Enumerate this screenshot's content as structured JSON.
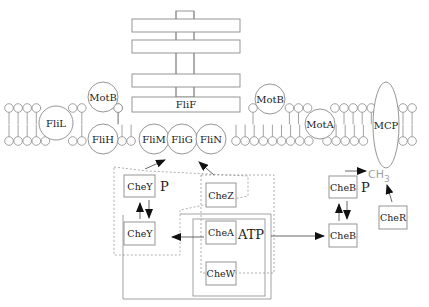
{
  "diagram": {
    "colors": {
      "line": "#8a8a8a",
      "dark_line": "#6e6e6e",
      "arrow": "#111111",
      "text": "#222222",
      "faint_text": "#9a9a9a",
      "background": "#ffffff"
    },
    "basal_body": {
      "fliF_label": "FliF",
      "rings": 4
    },
    "membrane": {
      "proteins": {
        "motB_left": "MotB",
        "fliL": "FliL",
        "fliH": "FliH",
        "motB_right": "MotB",
        "motA": "MotA",
        "mcp": "MCP"
      }
    },
    "switch_complex": {
      "fliM": "FliM",
      "fliG": "FliG",
      "fliN": "FliN"
    },
    "cytoplasm": {
      "cheY_p": "CheY",
      "cheY_p_suffix": "P",
      "cheZ": "CheZ",
      "cheY": "CheY",
      "cheA": "CheA",
      "atp": "ATP",
      "cheW": "CheW",
      "cheB_p": "CheB",
      "cheB_p_suffix": "P",
      "cheB": "CheB",
      "cheR": "CheR",
      "methyl": "CH",
      "methyl_sub": "3"
    }
  }
}
